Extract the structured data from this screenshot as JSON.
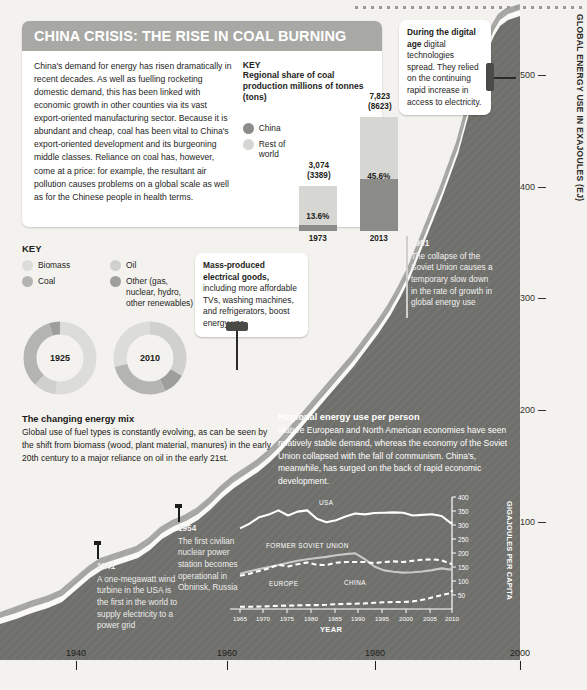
{
  "panel": {
    "title": "CHINA CRISIS: THE RISE IN COAL BURNING",
    "intro": "China's demand for energy has risen dramatically in recent decades. As well as fuelling rocketing domestic demand, this has been linked with economic growth in other counties via its vast export-oriented manufacturing sector. Because it is abundant and cheap, coal has been vital to China's export-oriented development and its burgeoning middle classes. Reliance on coal has, however, come at a price: for example, the resultant air pollution causes problems on a global scale as well as for the Chinese people in health terms.",
    "key_heading": "KEY",
    "key_sub": "Regional share of coal production millions of tonnes (tons)",
    "legend": [
      {
        "label": "China",
        "color": "#8c8c88"
      },
      {
        "label": "Rest of world",
        "color": "#d6d6d2"
      }
    ]
  },
  "coal_chart": {
    "type": "bar",
    "title": "Regional share of coal production millions of tonnes (tons)",
    "ylabel": "millions of tonnes (tons)",
    "categories": [
      "1973",
      "2013"
    ],
    "bars": [
      {
        "year": "1973",
        "total": "3,074",
        "total_alt": "(3389)",
        "china_pct": "13.6%",
        "china_share": 13.6,
        "rest_share": 86.4,
        "total_value": 3074,
        "total_tons": 3389
      },
      {
        "year": "2013",
        "total": "7,823",
        "total_alt": "(8623)",
        "china_pct": "45.6%",
        "china_share": 45.6,
        "rest_share": 54.4,
        "total_value": 7823,
        "total_tons": 8623
      }
    ],
    "series": [
      {
        "name": "China",
        "values": [
          13.6,
          45.6
        ],
        "color": "#8c8c88"
      },
      {
        "name": "Rest of world",
        "values": [
          86.4,
          54.4
        ],
        "color": "#d6d6d2"
      }
    ]
  },
  "fuel_key": {
    "title": "KEY",
    "items": [
      {
        "label": "Biomass",
        "color": "#dcdcd8"
      },
      {
        "label": "Coal",
        "color": "#b4b4b0"
      },
      {
        "label": "Oil",
        "color": "#d0d0cc"
      },
      {
        "label": "Other (gas, nuclear, hydro, other renewables)",
        "color": "#9e9e9a"
      }
    ]
  },
  "donuts": {
    "type": "pie",
    "title": "The changing energy mix",
    "charts": [
      {
        "label": "1925",
        "slices": [
          {
            "name": "Biomass",
            "value": 52,
            "color": "#dcdcd8"
          },
          {
            "name": "Oil",
            "value": 10,
            "color": "#d0d0cc"
          },
          {
            "name": "Coal",
            "value": 33,
            "color": "#b4b4b0"
          },
          {
            "name": "Other (gas, nuclear, hydro, other renewables)",
            "value": 5,
            "color": "#9e9e9a"
          }
        ]
      },
      {
        "label": "2010",
        "slices": [
          {
            "name": "Oil",
            "value": 33,
            "color": "#d0d0cc"
          },
          {
            "name": "Other (gas, nuclear, hydro, other renewables)",
            "value": 10,
            "color": "#9e9e9a"
          },
          {
            "name": "Coal",
            "value": 28,
            "color": "#b4b4b0"
          },
          {
            "name": "Biomass",
            "value": 29,
            "color": "#dcdcd8"
          }
        ]
      }
    ]
  },
  "energy_mix": {
    "heading": "The changing energy mix",
    "body": "Global use of fuel types is constantly evolving, as can be seen by the shift from biomass (wood, plant material, manures) in the early 20th century to a major reliance on oil in the early 21st."
  },
  "regional": {
    "heading": "Regional energy use per person",
    "body": "Mature European and North American economies have seen relatively stable demand, whereas the economy of the Soviet Union collapsed with the fall of communism. China's, meanwhile, has surged on the back of rapid economic development."
  },
  "callouts": {
    "digital": {
      "bold": "During the digital age",
      "body": " digital technologies spread. They relied on the continuing rapid increase in access to electricity."
    },
    "mass": {
      "bold": "Mass-produced electrical goods,",
      "body": " including more affordable TVs, washing machines, and refrigerators, boost energy use."
    }
  },
  "annotations": [
    {
      "year": "1991",
      "body": "The collapse of the Soviet Union causes a temporary slow down in the rate of growth in global energy use"
    },
    {
      "year": "1954",
      "body": "The first civilian nuclear power station becomes operational in Obninsk, Russia"
    },
    {
      "year": "1941",
      "body": "A one-megawatt wind turbine in the USA is the first in the world to supply electricity to a power grid"
    }
  ],
  "main_chart": {
    "type": "area",
    "ylabel": "GLOBAL ENERGY USE IN EXAJOULES (EJ)",
    "yticks": [
      "100",
      "200",
      "300",
      "400",
      "500"
    ],
    "ylim": [
      0,
      580
    ],
    "xticks": [
      "1940",
      "1960",
      "1980",
      "2000"
    ],
    "xlim": [
      1900,
      2013
    ],
    "series": [
      {
        "name": "Global energy use",
        "x": [
          1900,
          1910,
          1920,
          1925,
          1930,
          1935,
          1940,
          1945,
          1950,
          1955,
          1960,
          1965,
          1970,
          1975,
          1980,
          1985,
          1990,
          1995,
          2000,
          2005,
          2010,
          2013
        ],
        "values": [
          22,
          34,
          42,
          48,
          52,
          58,
          68,
          72,
          92,
          112,
          140,
          170,
          215,
          245,
          285,
          305,
          345,
          360,
          400,
          455,
          510,
          545
        ]
      }
    ]
  },
  "inset_chart": {
    "type": "line",
    "title": "Regional energy use per person",
    "xlabel": "YEAR",
    "ylabel": "GIGAJOULES PER CAPITA",
    "xticks": [
      "1965",
      "1970",
      "1975",
      "1980",
      "1985",
      "1990",
      "1995",
      "2000",
      "2005",
      "2010"
    ],
    "yticks": [
      "50",
      "100",
      "150",
      "200",
      "250",
      "300",
      "350",
      "400"
    ],
    "ylim": [
      0,
      400
    ],
    "xlim": [
      1965,
      2011
    ],
    "series": [
      {
        "name": "USA",
        "style": "solid",
        "x": [
          1965,
          1967,
          1969,
          1971,
          1973,
          1975,
          1977,
          1979,
          1981,
          1983,
          1985,
          1987,
          1989,
          1991,
          1993,
          1995,
          1997,
          1999,
          2001,
          2003,
          2005,
          2007,
          2009,
          2011
        ],
        "values": [
          288,
          305,
          328,
          337,
          352,
          334,
          348,
          352,
          322,
          310,
          317,
          330,
          341,
          338,
          343,
          344,
          345,
          344,
          334,
          336,
          338,
          332,
          306,
          311
        ]
      },
      {
        "name": "FORMER SOVIET UNION",
        "style": "solid",
        "x": [
          1965,
          1967,
          1969,
          1971,
          1973,
          1975,
          1977,
          1979,
          1981,
          1983,
          1985,
          1987,
          1989,
          1991,
          1993,
          1995,
          1997,
          1999,
          2001,
          2003,
          2005,
          2007,
          2009,
          2011
        ],
        "values": [
          125,
          134,
          142,
          150,
          157,
          165,
          172,
          178,
          182,
          186,
          192,
          196,
          199,
          178,
          152,
          138,
          133,
          130,
          131,
          134,
          139,
          145,
          140,
          152
        ]
      },
      {
        "name": "EUROPE",
        "style": "dashed",
        "x": [
          1965,
          1967,
          1969,
          1971,
          1973,
          1975,
          1977,
          1979,
          1981,
          1983,
          1985,
          1987,
          1989,
          1991,
          1993,
          1995,
          1997,
          1999,
          2001,
          2003,
          2005,
          2007,
          2009,
          2011
        ],
        "values": [
          118,
          126,
          136,
          145,
          158,
          152,
          160,
          166,
          158,
          157,
          165,
          168,
          168,
          168,
          164,
          168,
          170,
          168,
          172,
          176,
          177,
          174,
          161,
          162
        ]
      },
      {
        "name": "CHINA",
        "style": "dashed",
        "x": [
          1965,
          1967,
          1969,
          1971,
          1973,
          1975,
          1977,
          1979,
          1981,
          1983,
          1985,
          1987,
          1989,
          1991,
          1993,
          1995,
          1997,
          1999,
          2001,
          2003,
          2005,
          2007,
          2009,
          2011
        ],
        "values": [
          8,
          8,
          9,
          10,
          11,
          12,
          13,
          14,
          14,
          15,
          17,
          18,
          19,
          20,
          22,
          24,
          25,
          25,
          27,
          33,
          41,
          50,
          57,
          68
        ]
      }
    ]
  }
}
